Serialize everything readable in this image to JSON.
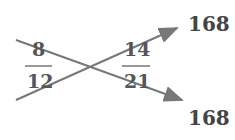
{
  "diagram": {
    "left_fraction": {
      "numerator": "8",
      "denominator": "12"
    },
    "right_fraction": {
      "numerator": "14",
      "denominator": "21"
    },
    "products": {
      "top": "168",
      "bottom": "168"
    },
    "colors": {
      "stroke": "#777777",
      "text": "#555555"
    }
  }
}
